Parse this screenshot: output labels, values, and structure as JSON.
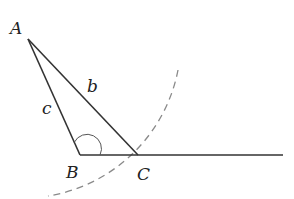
{
  "diagram": {
    "points": {
      "A": {
        "label": "A"
      },
      "B": {
        "label": "B"
      },
      "C": {
        "label": "C"
      }
    },
    "sides": {
      "b": {
        "label": "b"
      },
      "c": {
        "label": "c"
      }
    },
    "colors": {
      "line": "#333333",
      "arc": "#8a8a8a"
    }
  }
}
